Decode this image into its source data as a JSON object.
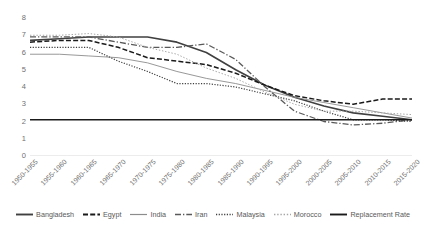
{
  "chart_data": {
    "type": "line",
    "title": "",
    "subtitle": "",
    "xlabel": "",
    "ylabel": "",
    "ylim": [
      0,
      8
    ],
    "yticks": [
      0,
      1,
      2,
      3,
      4,
      5,
      6,
      7,
      8
    ],
    "grid": false,
    "legend_position": "bottom",
    "categories": [
      "1950-1955",
      "1955-1960",
      "1960-1965",
      "1965-1970",
      "1970-1975",
      "1975-1980",
      "1980-1985",
      "1985-1990",
      "1990-1995",
      "1995-2000",
      "2000-2005",
      "2005-2010",
      "2010-2015",
      "2015-2020"
    ],
    "series": [
      {
        "name": "Bangladesh",
        "style": "solid-thick",
        "color": "#404040",
        "values": [
          6.7,
          6.8,
          6.9,
          6.9,
          6.9,
          6.6,
          6.0,
          5.0,
          4.1,
          3.4,
          2.9,
          2.5,
          2.3,
          2.1
        ]
      },
      {
        "name": "Egypt",
        "style": "dashed",
        "color": "#1a1a1a",
        "values": [
          6.6,
          6.7,
          6.7,
          6.3,
          5.7,
          5.5,
          5.3,
          4.8,
          4.1,
          3.5,
          3.2,
          3.0,
          3.3,
          3.3
        ]
      },
      {
        "name": "India",
        "style": "solid-thin",
        "color": "#8c8c8c",
        "values": [
          5.9,
          5.9,
          5.8,
          5.7,
          5.4,
          4.9,
          4.5,
          4.2,
          3.8,
          3.4,
          3.1,
          2.8,
          2.5,
          2.2
        ]
      },
      {
        "name": "Iran",
        "style": "dash-dot",
        "color": "#595959",
        "values": [
          6.9,
          6.9,
          6.9,
          6.6,
          6.3,
          6.3,
          6.5,
          5.6,
          4.0,
          2.6,
          2.0,
          1.8,
          1.9,
          2.1
        ]
      },
      {
        "name": "Malaysia",
        "style": "dotted",
        "color": "#3f3f3f",
        "values": [
          6.3,
          6.3,
          6.3,
          5.5,
          4.9,
          4.2,
          4.2,
          4.0,
          3.6,
          3.2,
          2.6,
          2.1,
          2.1,
          2.0
        ]
      },
      {
        "name": "Morocco",
        "style": "dotted-light",
        "color": "#a6a6a6",
        "values": [
          7.0,
          7.0,
          7.1,
          6.9,
          6.3,
          5.9,
          5.1,
          4.5,
          3.7,
          3.0,
          2.6,
          2.6,
          2.5,
          2.4
        ]
      },
      {
        "name": "Replacement Rate",
        "style": "solid-thick",
        "color": "#1a1a1a",
        "values": [
          2.1,
          2.1,
          2.1,
          2.1,
          2.1,
          2.1,
          2.1,
          2.1,
          2.1,
          2.1,
          2.1,
          2.1,
          2.1,
          2.1
        ]
      }
    ]
  },
  "axis": {
    "y_tick_labels": [
      "8",
      "7",
      "6",
      "5",
      "4",
      "3",
      "2",
      "1",
      "0"
    ]
  },
  "legend": {
    "items": [
      {
        "label": "Bangladesh"
      },
      {
        "label": "Egypt"
      },
      {
        "label": "India"
      },
      {
        "label": "Iran"
      },
      {
        "label": "Malaysia"
      },
      {
        "label": "Morocco"
      },
      {
        "label": "Replacement Rate"
      }
    ]
  }
}
